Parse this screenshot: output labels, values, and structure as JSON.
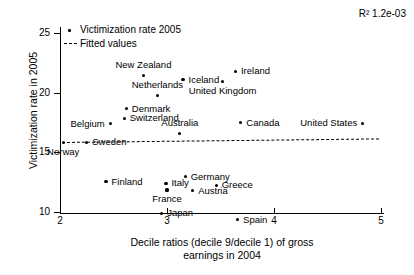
{
  "chart_data": {
    "type": "scatter",
    "title": "",
    "xlabel": "Decile ratios (decile 9/decile 1) of gross earnings in 2004",
    "xlabel_line1": "Decile ratios (decile 9/decile 1) of gross",
    "xlabel_line2": "earnings in 2004",
    "ylabel": "Victimization rate in 2005",
    "xlim": [
      2,
      5
    ],
    "ylim": [
      9,
      25.8
    ],
    "xticks": [
      2,
      3,
      4,
      5
    ],
    "xtick_labels": [
      "2",
      "3",
      "4",
      "5"
    ],
    "yticks": [
      10,
      15,
      20,
      25
    ],
    "ytick_labels": [
      "10",
      "15",
      "20",
      "25"
    ],
    "grid": false,
    "annotation": "R² 1.2e-03",
    "legend_position": "top-left",
    "legend": [
      {
        "label": "Victimization rate 2005",
        "marker": "dot"
      },
      {
        "label": "Fitted values",
        "marker": "dashed-line"
      }
    ],
    "series": [
      {
        "name": "Victimization rate 2005",
        "points": [
          {
            "label": "Norway",
            "x": 2.03,
            "y": 15.85,
            "label_pos": "below"
          },
          {
            "label": "Sweden",
            "x": 2.25,
            "y": 15.85,
            "label_pos": "right"
          },
          {
            "label": "Belgium",
            "x": 2.47,
            "y": 17.4,
            "label_pos": "left"
          },
          {
            "label": "Finland",
            "x": 2.43,
            "y": 12.55,
            "label_pos": "right"
          },
          {
            "label": "Switzerland",
            "x": 2.6,
            "y": 17.85,
            "label_pos": "right"
          },
          {
            "label": "Denmark",
            "x": 2.62,
            "y": 18.65,
            "label_pos": "right"
          },
          {
            "label": "New Zealand",
            "x": 2.78,
            "y": 21.45,
            "label_pos": "above"
          },
          {
            "label": "Netherlands",
            "x": 2.91,
            "y": 19.75,
            "label_pos": "above"
          },
          {
            "label": "Japan",
            "x": 2.95,
            "y": 9.9,
            "label_pos": "right"
          },
          {
            "label": "Italy",
            "x": 2.99,
            "y": 12.4,
            "label_pos": "right"
          },
          {
            "label": "France",
            "x": 3.0,
            "y": 11.85,
            "label_pos": "below"
          },
          {
            "label": "Australia",
            "x": 3.12,
            "y": 16.55,
            "label_pos": "above"
          },
          {
            "label": "Germany",
            "x": 3.17,
            "y": 12.95,
            "label_pos": "right"
          },
          {
            "label": "Iceland",
            "x": 3.15,
            "y": 21.1,
            "label_pos": "right"
          },
          {
            "label": "Austria",
            "x": 3.24,
            "y": 11.8,
            "label_pos": "right"
          },
          {
            "label": "United Kingdom",
            "x": 3.52,
            "y": 20.95,
            "label_pos": "below"
          },
          {
            "label": "Greece",
            "x": 3.46,
            "y": 12.25,
            "label_pos": "right"
          },
          {
            "label": "Ireland",
            "x": 3.64,
            "y": 21.8,
            "label_pos": "right"
          },
          {
            "label": "Canada",
            "x": 3.69,
            "y": 17.5,
            "label_pos": "right"
          },
          {
            "label": "Spain",
            "x": 3.66,
            "y": 9.35,
            "label_pos": "right"
          },
          {
            "label": "United States",
            "x": 4.83,
            "y": 17.45,
            "label_pos": "left"
          }
        ]
      },
      {
        "name": "Fitted values",
        "type": "line",
        "style": "dashed",
        "x_start": 2.02,
        "x_end": 4.98,
        "y_start": 15.9,
        "y_end": 16.2
      }
    ]
  }
}
